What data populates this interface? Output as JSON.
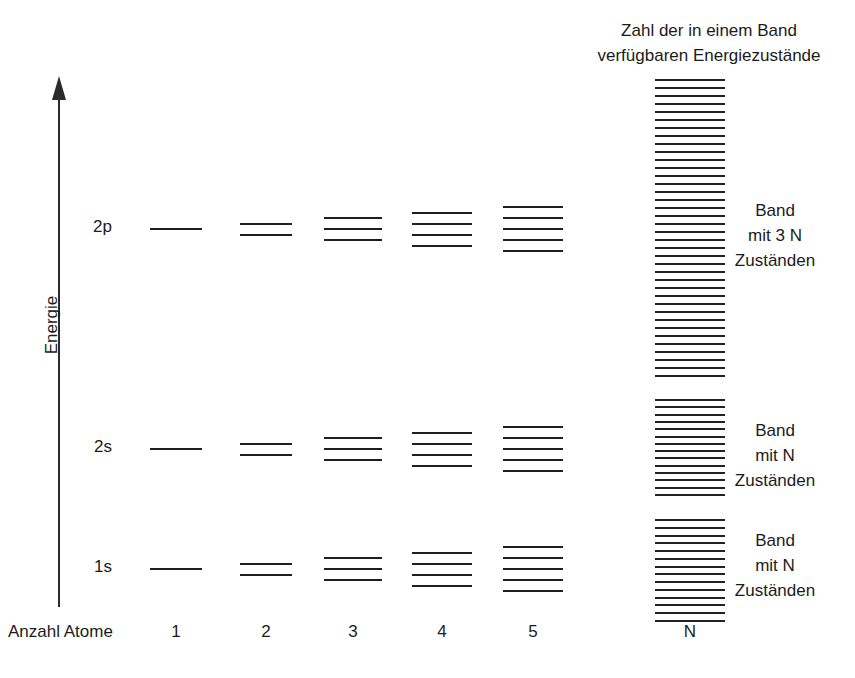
{
  "heading": "Zahl der in einem Band\nverfügbaren Energiezustände",
  "axis": {
    "energy_label": "Energie",
    "atom_count_label": "Anzahl Atome",
    "column_ticks": [
      "1",
      "2",
      "3",
      "4",
      "5",
      "N"
    ]
  },
  "orbitals": [
    {
      "label": "2p"
    },
    {
      "label": "2s"
    },
    {
      "label": "1s"
    }
  ],
  "band_captions": [
    "Band\nmit 3 N\nZuständen",
    "Band\nmit N\nZuständen",
    "Band\nmit N\nZuständen"
  ],
  "colors": {
    "ink": "#1f1f1f",
    "text": "#1b1b1b",
    "background": "#ffffff"
  },
  "chart_data": {
    "type": "diagram",
    "title": "Zahl der in einem Band verfügbaren Energiezustände",
    "xlabel": "Anzahl Atome",
    "ylabel": "Energie",
    "categories": [
      "1",
      "2",
      "3",
      "4",
      "5",
      "N"
    ],
    "series": [
      {
        "name": "2p",
        "level_counts": [
          1,
          2,
          3,
          4,
          5,
          38
        ],
        "band_states": "3 N"
      },
      {
        "name": "2s",
        "level_counts": [
          1,
          2,
          3,
          4,
          5,
          14
        ],
        "band_states": "N"
      },
      {
        "name": "1s",
        "level_counts": [
          1,
          2,
          3,
          4,
          5,
          14
        ],
        "band_states": "N"
      }
    ],
    "grid": false,
    "legend": "none"
  }
}
